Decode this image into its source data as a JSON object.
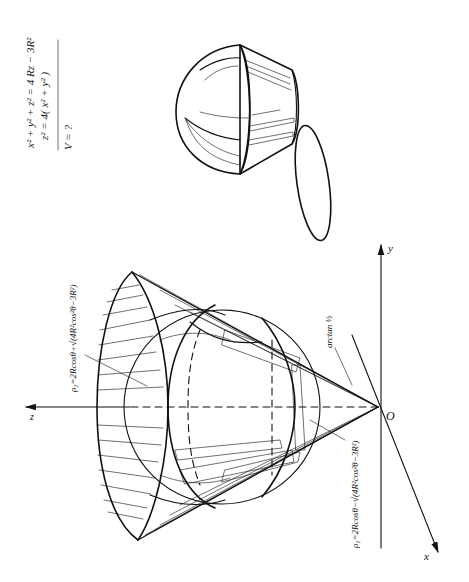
{
  "formulas": {
    "sphere_equation": "x² + y² + z² = 4 Rz − 3R²",
    "cone_equation": "z² = 4( x² + y² )",
    "question": "V = ?"
  },
  "labels": {
    "rho2": "ρ₂=2Rcosθ+√(4R²cos²θ−3R²)",
    "rho1": "ρ₁=2Rcosθ−√(4R²cos²θ−3R²)",
    "angle": "arctan ½",
    "origin": "O",
    "axis_x": "x",
    "axis_y": "y",
    "axis_z": "z"
  },
  "figures": {
    "main": "cone with apex at origin intersecting sphere (spherical-coordinate region)",
    "inset": "solid region between sphere and cone, with stippled cross-section"
  },
  "colors": {
    "ink": "#111111",
    "background": "#ffffff"
  }
}
